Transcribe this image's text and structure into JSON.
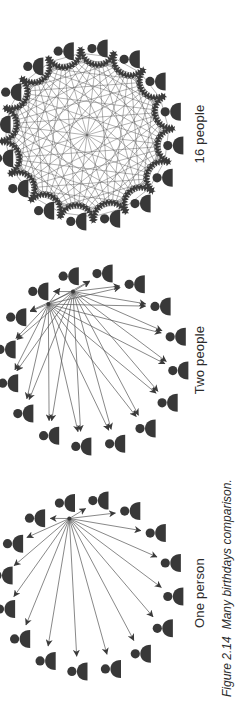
{
  "figure": {
    "caption": {
      "label": "Figure 2.14",
      "text": "Many birthdays comparison."
    },
    "panels": [
      {
        "id": "one-person",
        "label": "One person",
        "people_count": 16,
        "connection_mode": "fan",
        "source_count": 1,
        "source_indices": [
          15
        ],
        "arrow_count": 15
      },
      {
        "id": "two-people",
        "label": "Two people",
        "people_count": 16,
        "connection_mode": "fan",
        "source_count": 2,
        "source_indices": [
          14,
          15
        ],
        "arrow_count": 30
      },
      {
        "id": "sixteen-people",
        "label": "16 people",
        "people_count": 16,
        "connection_mode": "complete",
        "source_count": 16,
        "source_indices": [],
        "arrow_count": 120
      }
    ],
    "colors": {
      "person": "#383838",
      "line": "#555555",
      "arrowhead": "#3a3a3a",
      "label_text": "#2b2b2b",
      "caption_text": "#2b2b2b",
      "background": "#ffffff"
    }
  }
}
